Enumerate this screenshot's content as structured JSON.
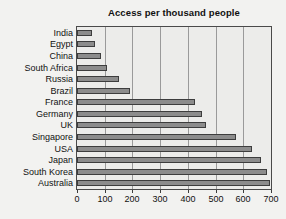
{
  "chart_data": {
    "type": "bar",
    "orientation": "horizontal",
    "title": "Access per thousand people",
    "xlabel": "",
    "ylabel": "",
    "categories": [
      "India",
      "Egypt",
      "China",
      "South Africa",
      "Russia",
      "Brazil",
      "France",
      "Germany",
      "UK",
      "Singapore",
      "USA",
      "Japan",
      "South Korea",
      "Australia"
    ],
    "values": [
      55,
      66,
      88,
      110,
      152,
      192,
      425,
      450,
      466,
      572,
      630,
      665,
      686,
      698
    ],
    "xlim": [
      0,
      700
    ],
    "xticks": [
      0,
      100,
      200,
      300,
      400,
      500,
      600,
      700
    ],
    "xtick_labels": [
      "0",
      "100",
      "200",
      "300",
      "400",
      "500",
      "600",
      "700"
    ],
    "grid": "vertical",
    "legend": "none",
    "colors": {
      "bar_fill": "#8c8c8c",
      "bar_edge": "#3d3d3d",
      "plot_background": "#ececea",
      "figure_background": "#f2f2f0",
      "gridline": "#9a9a9a",
      "axis": "#4a4a4a",
      "text": "#111111"
    }
  }
}
